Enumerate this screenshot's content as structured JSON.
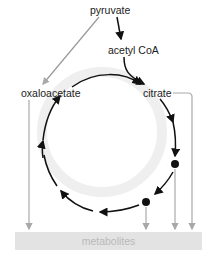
{
  "diagram": {
    "nodes": {
      "pyruvate": "pyruvate",
      "acetyl_coa": "acetyl CoA",
      "oxaloacetate": "oxaloacetate",
      "citrate": "citrate",
      "metabolites": "metabolites"
    },
    "edges": [
      {
        "from": "pyruvate",
        "to": "acetyl CoA",
        "style": "black-arrow"
      },
      {
        "from": "pyruvate",
        "to": "oxaloacetate",
        "style": "gray-arrow"
      },
      {
        "from": "acetyl CoA",
        "to": "citrate",
        "style": "black-arrow"
      },
      {
        "from": "oxaloacetate",
        "to": "citrate",
        "style": "black-arrow"
      },
      {
        "from": "oxaloacetate",
        "to": "metabolites",
        "style": "gray-arrow"
      },
      {
        "from": "citrate",
        "to": "metabolites",
        "style": "gray-arrow"
      },
      {
        "from": "intermediate-1",
        "to": "metabolites",
        "style": "gray-arrow"
      },
      {
        "from": "intermediate-2",
        "to": "metabolites",
        "style": "gray-arrow"
      }
    ],
    "colors": {
      "cycle_arrow": "#111111",
      "drain_arrow": "#a8a8a8",
      "metabolites_box": "#e3e3e3",
      "metabolites_text": "#b9b9b9",
      "cycle_glow": "#eeeeee"
    }
  }
}
